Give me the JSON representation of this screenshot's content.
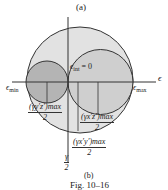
{
  "figure": {
    "part_a_label": "(a)",
    "part_b_label": "(b)",
    "caption": "Fig. 10–16"
  },
  "axes": {
    "horizontal_label": "ϵ",
    "vertical_label_num": "γ",
    "vertical_label_den": "2"
  },
  "labels": {
    "eps_min_symbol": "ϵ",
    "eps_min_sub": "min",
    "eps_max_symbol": "ϵ",
    "eps_max_sub": "max",
    "eps_int_symbol": "ϵ",
    "eps_int_sub": "int",
    "eps_int_value": " = 0",
    "gamma_yz": {
      "num": "(γy′z′)max",
      "den": "2"
    },
    "gamma_xz": {
      "num": "(γx′z′)max",
      "den": "2"
    },
    "gamma_xy": {
      "num": "(γx′y′)max",
      "den": "2"
    }
  },
  "colors": {
    "big_circle_fill": "#e2e2e2",
    "left_circle_fill": "#b4b4b4",
    "right_circle_fill": "#cfcfcf",
    "stroke": "#333333"
  }
}
